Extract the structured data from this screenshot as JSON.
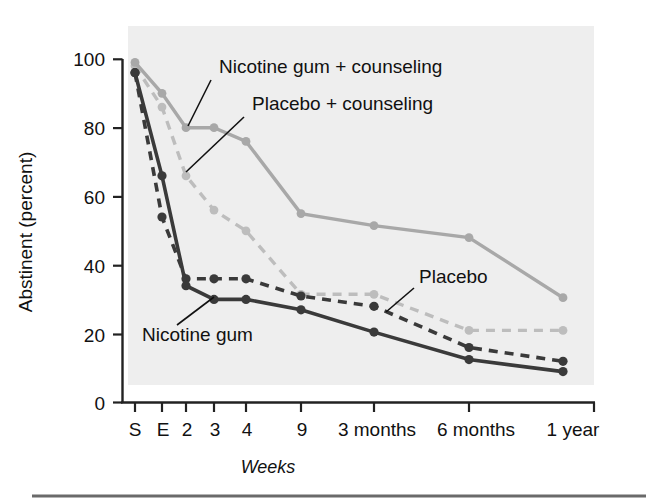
{
  "chart_data": {
    "type": "line",
    "title": "",
    "xlabel": "Weeks",
    "ylabel": "Abstinent (percent)",
    "categories": [
      "S",
      "E",
      "2",
      "3",
      "4",
      "9",
      "3 months",
      "6 months",
      "1 year"
    ],
    "xtick_labels": [
      "S",
      "E",
      "2",
      "3",
      "4",
      "9",
      "3 months",
      "6 months",
      "1 year"
    ],
    "ytick_labels": [
      "0",
      "20",
      "40",
      "60",
      "80",
      "100"
    ],
    "yticks": [
      0,
      20,
      40,
      60,
      80,
      100
    ],
    "ylim": [
      0,
      100
    ],
    "grid": false,
    "legend_position": "inline-annotations",
    "series": [
      {
        "name": "Nicotine gum + counseling",
        "style": "solid",
        "color": "#a8a8a8",
        "values": [
          99,
          90,
          80,
          80,
          76,
          55,
          51.5,
          48,
          30.5
        ]
      },
      {
        "name": "Placebo + counseling",
        "style": "dashed",
        "color": "#bdbdbd",
        "values": [
          98,
          86,
          66,
          56,
          50,
          31.5,
          31.5,
          21,
          21
        ]
      },
      {
        "name": "Nicotine gum",
        "style": "solid",
        "color": "#3a3a3a",
        "values": [
          96,
          66,
          34,
          30,
          30,
          27,
          20.5,
          12.5,
          9
        ]
      },
      {
        "name": "Placebo",
        "style": "dashed",
        "color": "#3a3a3a",
        "values": [
          96,
          54,
          36,
          36,
          36,
          31,
          28,
          16,
          12
        ]
      }
    ],
    "annotations": [
      {
        "name": "Nicotine gum + counseling",
        "text": "Nicotine gum + counseling"
      },
      {
        "name": "Placebo + counseling",
        "text": "Placebo + counseling"
      },
      {
        "name": "Nicotine gum",
        "text": "Nicotine gum"
      },
      {
        "name": "Placebo",
        "text": "Placebo"
      }
    ],
    "colors": {
      "panel_background": "#eeeeee",
      "axis": "#222222",
      "light_solid": "#a8a8a8",
      "light_dashed": "#bdbdbd",
      "dark": "#3a3a3a",
      "rule": "#6a6a6a"
    }
  }
}
